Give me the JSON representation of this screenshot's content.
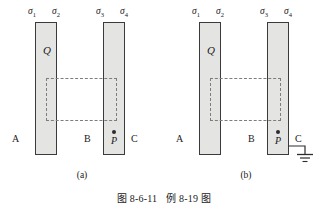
{
  "figure": {
    "caption_number": "图 8-6-11",
    "caption_text": "例 8-19 图"
  },
  "panels": [
    {
      "id": "a",
      "subcaption": "(a)",
      "charge_label": "Q",
      "point_label": "P",
      "surface_charge_labels": [
        "σ",
        "σ",
        "σ",
        "σ"
      ],
      "surface_charge_subscripts": [
        "1",
        "2",
        "3",
        "4"
      ],
      "regions": [
        "A",
        "B",
        "C"
      ],
      "grounded": false
    },
    {
      "id": "b",
      "subcaption": "(b)",
      "charge_label": "Q",
      "point_label": "P",
      "surface_charge_labels": [
        "σ",
        "σ",
        "σ",
        "σ"
      ],
      "surface_charge_subscripts": [
        "1",
        "2",
        "3",
        "4"
      ],
      "regions": [
        "A",
        "B",
        "C"
      ],
      "grounded": true
    }
  ],
  "colors": {
    "plate_fill": "#e4e4e2",
    "plate_stroke": "#3a3a3a",
    "gaussian_dash": "#7d7d7d",
    "text": "#1a1a1a",
    "background": "#ffffff"
  }
}
